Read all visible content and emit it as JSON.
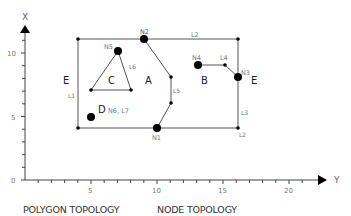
{
  "figure": {
    "captions": [
      "POLYGON TOPOLOGY",
      "NODE TOPOLOGY"
    ],
    "axes": {
      "x_axis_label": "Y",
      "y_axis_label": "X",
      "x_ticks": [
        "5",
        "10",
        "15",
        "20"
      ],
      "y_ticks": [
        "0",
        "5",
        "10"
      ],
      "x_range": [
        0,
        22
      ],
      "y_range": [
        0,
        11.5
      ]
    },
    "polygons": [
      {
        "id": "A",
        "label": "A"
      },
      {
        "id": "B",
        "label": "B"
      },
      {
        "id": "C",
        "label": "C"
      },
      {
        "id": "D",
        "label": "D",
        "note": "N6, L7"
      },
      {
        "id": "E",
        "label": "E"
      }
    ],
    "nodes": [
      {
        "id": "N1",
        "label": "N1",
        "x": 10,
        "y": 4
      },
      {
        "id": "N2",
        "label": "N2",
        "x": 9,
        "y": 11
      },
      {
        "id": "N3",
        "label": "N3",
        "x": 16,
        "y": 8
      },
      {
        "id": "N4",
        "label": "N4",
        "x": 13,
        "y": 9
      },
      {
        "id": "N5",
        "label": "N5",
        "x": 7,
        "y": 10
      },
      {
        "id": "N6",
        "label": "N6",
        "x": 5,
        "y": 5
      }
    ],
    "lines": [
      {
        "id": "L1",
        "label": "L1"
      },
      {
        "id": "L2",
        "label": "L2"
      },
      {
        "id": "L2b",
        "label": "L2"
      },
      {
        "id": "L3",
        "label": "L3"
      },
      {
        "id": "L4",
        "label": "L4"
      },
      {
        "id": "L5",
        "label": "L5"
      },
      {
        "id": "L6",
        "label": "L6"
      }
    ],
    "colors": {
      "line": "#555555",
      "node": "#000000",
      "text": "#333333",
      "light_text": "#777777"
    }
  }
}
